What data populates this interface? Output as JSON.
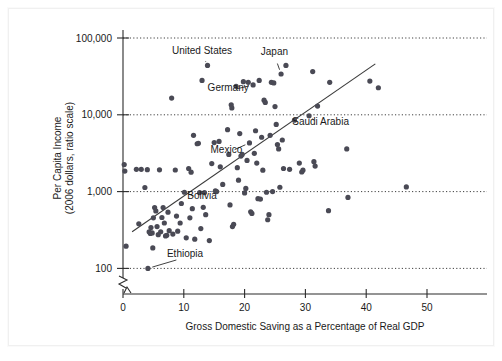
{
  "figure": {
    "background_color": "#ffffff",
    "point_color": "#4a4a55",
    "line_color": "#3a3a3a",
    "text_color": "#1a1a1a"
  },
  "chart_data": {
    "type": "scatter",
    "title": "",
    "subtitle": "",
    "xlabel": "Gross Domestic Saving as a Percentage of Real GDP",
    "ylabel_line1": "Per Capita Income",
    "ylabel_line2": "(2006 dollars, ratio scale)",
    "xlim": [
      0,
      56
    ],
    "ylim": [
      100,
      100000
    ],
    "yscale": "log",
    "xscale": "linear",
    "grid": "horizontal-dotted-at-ylabels",
    "legend": "none",
    "axis_break": "y-axis broken below 100",
    "xticks": [
      0,
      10,
      20,
      30,
      40,
      50
    ],
    "xticklabels": [
      "0",
      "10",
      "20",
      "30",
      "40",
      "50"
    ],
    "yticks": [
      100,
      1000,
      10000,
      100000
    ],
    "yticklabels": [
      "100",
      "1,000",
      "10,000",
      "100,000"
    ],
    "trendline": {
      "x_start": 1.5,
      "y_start": 300,
      "x_end": 41.5,
      "y_end": 46000
    },
    "annotations": [
      {
        "text": "United States",
        "label_x": 13.0,
        "label_y": 62000,
        "point_x": 13.9,
        "point_y": 44000
      },
      {
        "text": "Japan",
        "label_x": 24.9,
        "label_y": 60000,
        "point_x": 26.0,
        "point_y": 34000
      },
      {
        "text": "Germany",
        "label_x": 17.3,
        "label_y": 20500,
        "point_x": 21.4,
        "point_y": 24500
      },
      {
        "text": "Saudi Arabia",
        "label_x": 32.5,
        "label_y": 7300,
        "point_x": 30.6,
        "point_y": 9700
      },
      {
        "text": "Mexico",
        "label_x": 17.0,
        "label_y": 3150,
        "point_x": 20.8,
        "point_y": 4300
      },
      {
        "text": "Bolivia",
        "label_x": 13.0,
        "label_y": 790,
        "point_x": 10.1,
        "point_y": 980
      },
      {
        "text": "Ethiopia",
        "label_x": 10.2,
        "label_y": 139,
        "point_x": 4.1,
        "point_y": 100
      }
    ],
    "points": [
      [
        0.2,
        2250
      ],
      [
        0.3,
        1850
      ],
      [
        0.5,
        195
      ],
      [
        2.2,
        1950
      ],
      [
        2.6,
        380
      ],
      [
        3.0,
        1950
      ],
      [
        3.6,
        1130
      ],
      [
        4.0,
        1930
      ],
      [
        4.1,
        100
      ],
      [
        4.3,
        300
      ],
      [
        4.5,
        285
      ],
      [
        4.6,
        340
      ],
      [
        4.8,
        290
      ],
      [
        4.9,
        185
      ],
      [
        5.0,
        455
      ],
      [
        5.2,
        620
      ],
      [
        5.4,
        560
      ],
      [
        5.6,
        350
      ],
      [
        5.8,
        275
      ],
      [
        6.0,
        1920
      ],
      [
        6.2,
        300
      ],
      [
        6.4,
        460
      ],
      [
        6.6,
        620
      ],
      [
        6.8,
        390
      ],
      [
        7.0,
        265
      ],
      [
        7.2,
        270
      ],
      [
        7.4,
        540
      ],
      [
        7.6,
        310
      ],
      [
        8.0,
        16500
      ],
      [
        8.2,
        280
      ],
      [
        8.6,
        1910
      ],
      [
        8.8,
        480
      ],
      [
        9.0,
        305
      ],
      [
        9.4,
        390
      ],
      [
        9.6,
        700
      ],
      [
        10.1,
        980
      ],
      [
        10.4,
        250
      ],
      [
        10.8,
        2000
      ],
      [
        11.0,
        455
      ],
      [
        11.2,
        1790
      ],
      [
        11.4,
        600
      ],
      [
        11.6,
        5400
      ],
      [
        11.8,
        240
      ],
      [
        12.2,
        4200
      ],
      [
        12.4,
        4250
      ],
      [
        12.6,
        970
      ],
      [
        12.8,
        330
      ],
      [
        13.0,
        28000
      ],
      [
        13.2,
        625
      ],
      [
        13.4,
        970
      ],
      [
        13.6,
        500
      ],
      [
        13.9,
        44000
      ],
      [
        14.2,
        230
      ],
      [
        14.6,
        2320
      ],
      [
        15.0,
        4350
      ],
      [
        15.2,
        1020
      ],
      [
        15.4,
        1000
      ],
      [
        15.8,
        4500
      ],
      [
        16.0,
        2100
      ],
      [
        16.4,
        1240
      ],
      [
        17.2,
        6400
      ],
      [
        17.4,
        3050
      ],
      [
        17.6,
        670
      ],
      [
        17.8,
        13500
      ],
      [
        17.9,
        12300
      ],
      [
        18.0,
        350
      ],
      [
        18.2,
        375
      ],
      [
        18.6,
        23500
      ],
      [
        18.8,
        2050
      ],
      [
        19.0,
        1410
      ],
      [
        19.2,
        5700
      ],
      [
        19.4,
        2900
      ],
      [
        19.6,
        3050
      ],
      [
        19.8,
        27000
      ],
      [
        20.0,
        960
      ],
      [
        20.2,
        1100
      ],
      [
        20.4,
        2550
      ],
      [
        20.6,
        26500
      ],
      [
        20.8,
        4300
      ],
      [
        21.0,
        545
      ],
      [
        21.2,
        520
      ],
      [
        21.4,
        24500
      ],
      [
        21.6,
        3150
      ],
      [
        21.8,
        6200
      ],
      [
        22.0,
        2350
      ],
      [
        22.2,
        810
      ],
      [
        22.4,
        28000
      ],
      [
        22.6,
        800
      ],
      [
        22.8,
        5100
      ],
      [
        23.0,
        1900
      ],
      [
        23.2,
        15500
      ],
      [
        23.4,
        14500
      ],
      [
        23.6,
        980
      ],
      [
        23.8,
        430
      ],
      [
        24.0,
        500
      ],
      [
        24.2,
        5400
      ],
      [
        24.4,
        26500
      ],
      [
        24.6,
        1000
      ],
      [
        24.8,
        26000
      ],
      [
        25.0,
        12800
      ],
      [
        25.2,
        7500
      ],
      [
        25.4,
        4100
      ],
      [
        25.6,
        3600
      ],
      [
        25.8,
        1140
      ],
      [
        26.0,
        34000
      ],
      [
        26.2,
        4700
      ],
      [
        26.4,
        2000
      ],
      [
        26.8,
        44000
      ],
      [
        27.4,
        1950
      ],
      [
        28.2,
        8500
      ],
      [
        29.0,
        2350
      ],
      [
        29.4,
        1800
      ],
      [
        29.6,
        1900
      ],
      [
        30.6,
        9700
      ],
      [
        31.2,
        36500
      ],
      [
        31.4,
        2450
      ],
      [
        31.6,
        2150
      ],
      [
        32.0,
        13000
      ],
      [
        33.8,
        565
      ],
      [
        34.0,
        26500
      ],
      [
        36.8,
        3600
      ],
      [
        37.0,
        840
      ],
      [
        40.6,
        27500
      ],
      [
        42.0,
        22500
      ],
      [
        46.6,
        1150
      ]
    ]
  }
}
